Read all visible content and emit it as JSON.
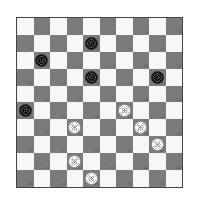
{
  "game": {
    "type": "international-draughts",
    "board_size": 10,
    "colors": {
      "light_square": "#f7f7f7",
      "dark_square": "#7b7b7b",
      "black_piece": "#111111",
      "white_piece": "#ffffff"
    },
    "pieces": [
      {
        "color": "black",
        "row": 1,
        "col": 4,
        "square": 8
      },
      {
        "color": "black",
        "row": 2,
        "col": 1,
        "square": 11
      },
      {
        "color": "black",
        "row": 3,
        "col": 4,
        "square": 18
      },
      {
        "color": "black",
        "row": 3,
        "col": 8,
        "square": 20
      },
      {
        "color": "black",
        "row": 5,
        "col": 0,
        "square": 26
      },
      {
        "color": "white",
        "row": 5,
        "col": 6,
        "square": 29
      },
      {
        "color": "white",
        "row": 6,
        "col": 3,
        "square": 32
      },
      {
        "color": "white",
        "row": 6,
        "col": 7,
        "square": 34
      },
      {
        "color": "white",
        "row": 7,
        "col": 8,
        "square": 40
      },
      {
        "color": "white",
        "row": 8,
        "col": 3,
        "square": 42
      },
      {
        "color": "white",
        "row": 9,
        "col": 4,
        "square": 48
      }
    ]
  }
}
